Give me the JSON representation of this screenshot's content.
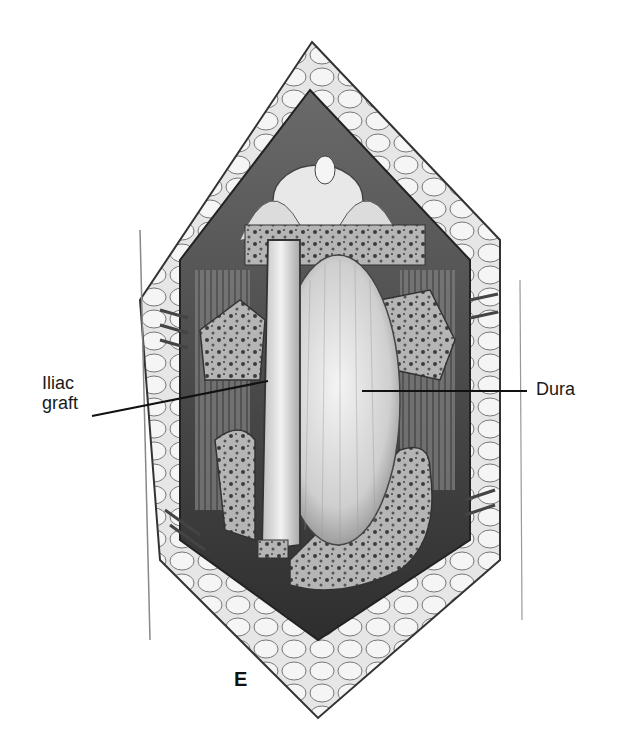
{
  "figure": {
    "panel_letter": "E",
    "labels": [
      {
        "id": "iliac-graft",
        "lines": [
          "Iliac",
          "graft"
        ],
        "text": "Iliac graft"
      },
      {
        "id": "dura",
        "lines": [
          "Dura"
        ],
        "text": "Dura"
      }
    ],
    "colors": {
      "background": "#ffffff",
      "ink": "#1a1a1a",
      "tissue_dark": "#3a3a3a",
      "tissue_mid": "#8c8c8c",
      "tissue_light": "#d9d9d9"
    }
  }
}
